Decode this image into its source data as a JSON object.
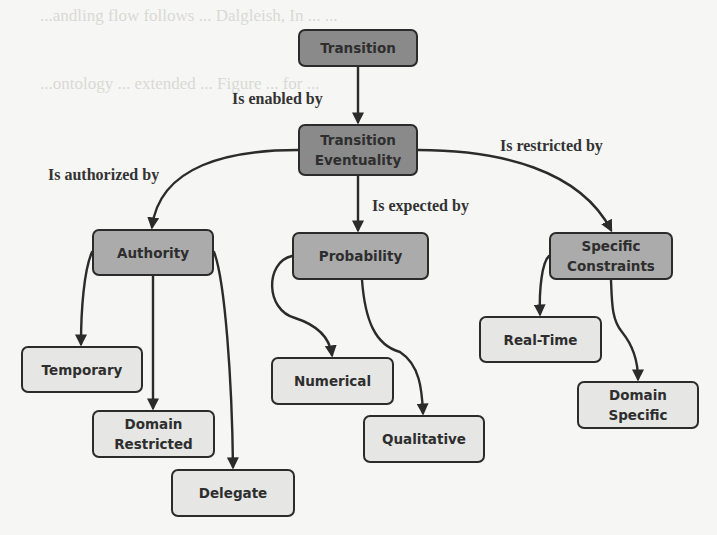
{
  "diagram": {
    "type": "concept-hierarchy",
    "colors": {
      "root_fill": "#8a8a8a",
      "category_fill": "#ababab",
      "leaf_fill": "#e6e6e4",
      "border": "#2b2b2b",
      "edge": "#2b2b2b",
      "background": "#f6f6f4"
    },
    "nodes": {
      "transition": "Transition",
      "transition_eventuality": "Transition\nEventuality",
      "authority": "Authority",
      "probability": "Probability",
      "specific_constraints": "Specific\nConstraints",
      "temporary": "Temporary",
      "domain_restricted": "Domain\nRestricted",
      "delegate": "Delegate",
      "numerical": "Numerical",
      "qualitative": "Qualitative",
      "real_time": "Real-Time",
      "domain_specific": "Domain\nSpecific"
    },
    "edge_labels": {
      "enabled": "Is enabled by",
      "authorized": "Is authorized by",
      "expected": "Is expected by",
      "restricted": "Is restricted by"
    },
    "edges": [
      {
        "from": "Transition",
        "to": "Transition Eventuality",
        "label": "Is enabled by"
      },
      {
        "from": "Transition Eventuality",
        "to": "Authority",
        "label": "Is authorized by"
      },
      {
        "from": "Transition Eventuality",
        "to": "Probability",
        "label": "Is expected by"
      },
      {
        "from": "Transition Eventuality",
        "to": "Specific Constraints",
        "label": "Is restricted by"
      },
      {
        "from": "Authority",
        "to": "Temporary"
      },
      {
        "from": "Authority",
        "to": "Domain Restricted"
      },
      {
        "from": "Authority",
        "to": "Delegate"
      },
      {
        "from": "Probability",
        "to": "Numerical"
      },
      {
        "from": "Probability",
        "to": "Qualitative"
      },
      {
        "from": "Specific Constraints",
        "to": "Real-Time"
      },
      {
        "from": "Specific Constraints",
        "to": "Domain Specific"
      }
    ]
  },
  "background_bleed": {
    "line1": "...andling flow follows ... Dalgleish, In ... ...",
    "line2": "...ontology ... extended ... Figure ... for ..."
  }
}
